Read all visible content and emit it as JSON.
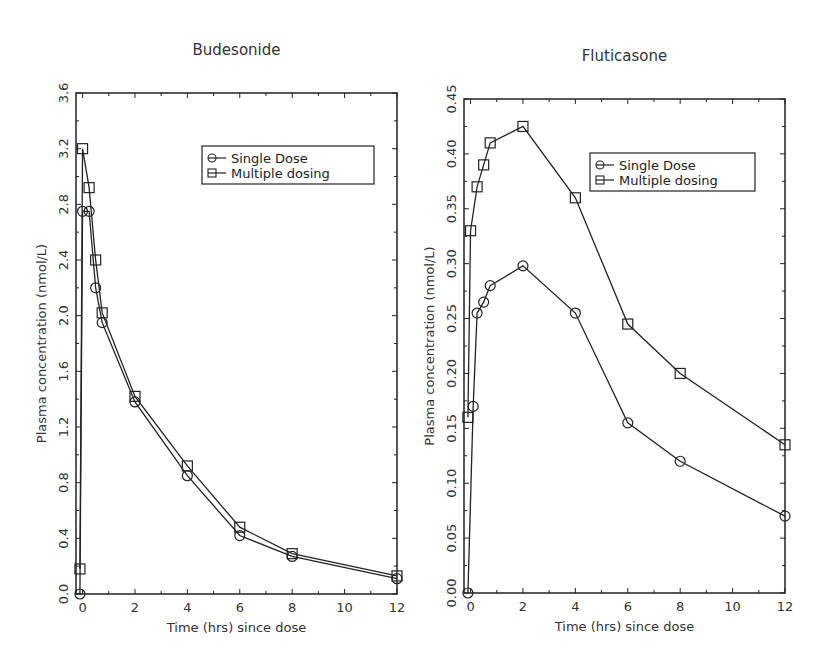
{
  "chart_data": [
    {
      "type": "line",
      "title": "Budesonide",
      "xlabel": "Time (hrs) since dose",
      "ylabel": "Plasma concentration (nmol/L)",
      "xlim": [
        -0.25,
        12
      ],
      "ylim": [
        0,
        3.6
      ],
      "xticks": [
        0,
        2,
        4,
        6,
        8,
        10,
        12
      ],
      "xtick_labels": [
        "0",
        "2",
        "4",
        "6",
        "8",
        "10",
        "12"
      ],
      "yticks": [
        0,
        0.4,
        0.8,
        1.2,
        1.6,
        2.0,
        2.4,
        2.8,
        3.2,
        3.6
      ],
      "ytick_labels": [
        "0.0",
        "0.4",
        "0.8",
        "1.2",
        "1.6",
        "2.0",
        "2.4",
        "2.8",
        "3.2",
        "3.6"
      ],
      "grid": false,
      "legend_position": "upper right",
      "series": [
        {
          "name": "Single Dose",
          "marker": "circle",
          "x": [
            -0.1,
            0,
            0.25,
            0.5,
            0.75,
            2,
            4,
            6,
            8,
            12
          ],
          "y": [
            0.0,
            2.75,
            2.75,
            2.2,
            1.95,
            1.38,
            0.85,
            0.42,
            0.27,
            0.11
          ]
        },
        {
          "name": "Multiple dosing",
          "marker": "square",
          "x": [
            -0.1,
            0,
            0.25,
            0.5,
            0.75,
            2,
            4,
            6,
            8,
            12
          ],
          "y": [
            0.18,
            3.2,
            2.92,
            2.4,
            2.02,
            1.42,
            0.92,
            0.48,
            0.29,
            0.13
          ]
        }
      ]
    },
    {
      "type": "line",
      "title": "Fluticasone",
      "xlabel": "Time (hrs) since dose",
      "ylabel": "Plasma concentration (nmol/L)",
      "xlim": [
        -0.25,
        12
      ],
      "ylim": [
        0,
        0.45
      ],
      "xticks": [
        0,
        2,
        4,
        6,
        8,
        10,
        12
      ],
      "xtick_labels": [
        "0",
        "2",
        "4",
        "6",
        "8",
        "10",
        "12"
      ],
      "yticks": [
        0,
        0.05,
        0.1,
        0.15,
        0.2,
        0.25,
        0.3,
        0.35,
        0.4,
        0.45
      ],
      "ytick_labels": [
        "0.00",
        "0.05",
        "0.10",
        "0.15",
        "0.20",
        "0.25",
        "0.30",
        "0.35",
        "0.40",
        "0.45"
      ],
      "grid": false,
      "legend_position": "upper right",
      "series": [
        {
          "name": "Single Dose",
          "marker": "circle",
          "x": [
            -0.1,
            0.1,
            0.25,
            0.5,
            0.75,
            2,
            4,
            6,
            8,
            12
          ],
          "y": [
            0.0,
            0.17,
            0.255,
            0.265,
            0.28,
            0.298,
            0.255,
            0.155,
            0.12,
            0.07
          ]
        },
        {
          "name": "Multiple dosing",
          "marker": "square",
          "x": [
            -0.1,
            0,
            0.25,
            0.5,
            0.75,
            2,
            4,
            6,
            8,
            12
          ],
          "y": [
            0.16,
            0.33,
            0.37,
            0.39,
            0.41,
            0.425,
            0.36,
            0.245,
            0.2,
            0.135
          ]
        }
      ]
    }
  ],
  "layout": {
    "plots": [
      {
        "left": 76,
        "top": 93,
        "right": 397,
        "bottom": 594,
        "legend": {
          "x": 202,
          "y": 146,
          "w": 172,
          "h": 38
        }
      },
      {
        "left": 464,
        "top": 99,
        "right": 785,
        "bottom": 593,
        "legend": {
          "x": 590,
          "y": 153,
          "w": 165,
          "h": 38
        }
      }
    ]
  }
}
